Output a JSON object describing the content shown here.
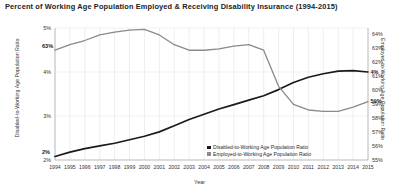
{
  "chart_data": {
    "type": "line",
    "title": "Percent of Working Age Population Employed & Receiving Disability Insurance (1994-2015)",
    "xlabel": "Year",
    "ylabel": "Disabled-to-Working Age Population Ratio",
    "y2label": "Employed-to-Working Age Population Ratio",
    "grid": true,
    "legend_position": "bottom-right",
    "x": [
      1994,
      1995,
      1996,
      1997,
      1998,
      1999,
      2000,
      2001,
      2002,
      2003,
      2004,
      2005,
      2006,
      2007,
      2008,
      2009,
      2010,
      2011,
      2012,
      2013,
      2014,
      2015
    ],
    "xtick_labels": [
      "1994",
      "1995",
      "1996",
      "1997",
      "1998",
      "1999",
      "2000",
      "2001",
      "2002",
      "2003",
      "2004",
      "2005",
      "2006",
      "2007",
      "2008",
      "2009",
      "2010",
      "2011",
      "2012",
      "2013",
      "2014",
      "2015"
    ],
    "ylim": [
      2,
      5
    ],
    "ytick_labels": [
      "5%",
      "4%",
      "3%",
      "2%"
    ],
    "ytick_values": [
      5,
      4,
      3,
      2
    ],
    "y2lim": [
      55,
      64.5
    ],
    "y2tick_labels": [
      "64%",
      "63%",
      "62%",
      "61%",
      "60%",
      "59%",
      "58%",
      "57%",
      "56%",
      "55%"
    ],
    "y2tick_values": [
      64,
      63,
      62,
      61,
      60,
      59,
      58,
      57,
      56,
      55
    ],
    "series": [
      {
        "name": "Disabled-to-Working Age Population Ratio",
        "axis": "left",
        "color": "#1a1a1a",
        "values": [
          2.08,
          2.18,
          2.26,
          2.32,
          2.38,
          2.46,
          2.54,
          2.64,
          2.78,
          2.92,
          3.04,
          3.16,
          3.26,
          3.36,
          3.46,
          3.6,
          3.76,
          3.88,
          3.96,
          4.02,
          4.03,
          4.0
        ]
      },
      {
        "name": "Employed-to-Working Age Population Ratio",
        "axis": "right",
        "color": "#8a8a8a",
        "values": [
          62.9,
          63.3,
          63.6,
          64.0,
          64.2,
          64.35,
          64.4,
          64.0,
          63.3,
          62.9,
          62.9,
          63.0,
          63.2,
          63.3,
          62.9,
          60.3,
          59.0,
          58.6,
          58.5,
          58.5,
          58.8,
          59.2
        ]
      }
    ],
    "annotations": [
      {
        "text": "63%",
        "series": "Employed-to-Working Age Population Ratio",
        "point": 1994
      },
      {
        "text": "2%",
        "series": "Disabled-to-Working Age Population Ratio",
        "point": 1994
      },
      {
        "text": "4%",
        "series": "Disabled-to-Working Age Population Ratio",
        "point": 2015
      },
      {
        "text": "59%",
        "series": "Employed-to-Working Age Population Ratio",
        "point": 2015
      }
    ]
  },
  "legend": {
    "items": [
      {
        "label": "Disabled-to-Working Age Population Ratio",
        "color": "#1a1a1a"
      },
      {
        "label": "Employed-to-Working Age Population Ratio",
        "color": "#8a8a8a"
      }
    ]
  }
}
